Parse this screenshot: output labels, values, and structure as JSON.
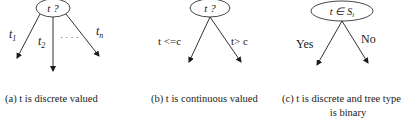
{
  "diagrams": [
    {
      "id": "a",
      "node_label": "t ?",
      "branches": [
        {
          "label": "t",
          "sub": "1"
        },
        {
          "label": "t",
          "sub": "2"
        },
        {
          "label": "t",
          "sub": "n"
        }
      ],
      "ellipsis": "· · · ·",
      "caption": "(a) t is discrete valued"
    },
    {
      "id": "b",
      "node_label": "t ?",
      "branches": [
        {
          "label": "t <=c"
        },
        {
          "label": "t> c"
        }
      ],
      "caption": "(b) t is continuous valued"
    },
    {
      "id": "c",
      "node_label": "t ∈ S",
      "node_sub": "i",
      "branches": [
        {
          "label": "Yes"
        },
        {
          "label": "No"
        }
      ],
      "caption_line1": "(c) t is discrete and tree type",
      "caption_line2": "is binary"
    }
  ]
}
